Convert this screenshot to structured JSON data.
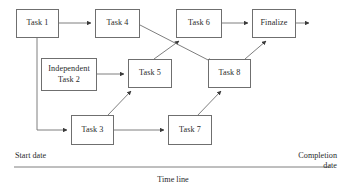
{
  "diagram": {
    "type": "node-link-flow",
    "line_color": "#6f6f6f",
    "text_color": "#2a2a2a",
    "background": "#ffffff",
    "nodes": [
      {
        "id": "task1",
        "label": "Task 1",
        "x": 16,
        "y": 9,
        "w": 43,
        "h": 29
      },
      {
        "id": "task4",
        "label": "Task 4",
        "x": 95,
        "y": 9,
        "w": 45,
        "h": 29
      },
      {
        "id": "task6",
        "label": "Task 6",
        "x": 176,
        "y": 9,
        "w": 46,
        "h": 29
      },
      {
        "id": "finalize",
        "label": "Finalize",
        "x": 252,
        "y": 9,
        "w": 44,
        "h": 29
      },
      {
        "id": "independent",
        "label": "Independent\nTask 2",
        "x": 41,
        "y": 58,
        "w": 56,
        "h": 33
      },
      {
        "id": "task5",
        "label": "Task 5",
        "x": 128,
        "y": 59,
        "w": 44,
        "h": 29
      },
      {
        "id": "task8",
        "label": "Task 8",
        "x": 208,
        "y": 59,
        "w": 43,
        "h": 29
      },
      {
        "id": "task3",
        "label": "Task 3",
        "x": 71,
        "y": 115,
        "w": 43,
        "h": 30
      },
      {
        "id": "task7",
        "label": "Task 7",
        "x": 168,
        "y": 115,
        "w": 44,
        "h": 30
      }
    ],
    "edges": [
      {
        "id": "e-task1-task4",
        "from": "task1",
        "to": "task4",
        "style": "straight-horizontal"
      },
      {
        "id": "e-task1-task3",
        "from": "task1",
        "to": "task3",
        "style": "orthogonal-down-right"
      },
      {
        "id": "e-independent-task5",
        "from": "independent",
        "to": "task5",
        "style": "straight-horizontal"
      },
      {
        "id": "e-task3-task5",
        "from": "task3",
        "to": "task5",
        "style": "diagonal-up-right"
      },
      {
        "id": "e-task3-task7",
        "from": "task3",
        "to": "task7",
        "style": "straight-horizontal"
      },
      {
        "id": "e-task5-task6",
        "from": "task5",
        "to": "task6",
        "style": "diagonal-up-right"
      },
      {
        "id": "e-task4-task8",
        "from": "task4",
        "to": "task8",
        "style": "diagonal-down-right"
      },
      {
        "id": "e-task7-task8",
        "from": "task7",
        "to": "task8",
        "style": "diagonal-up-right"
      },
      {
        "id": "e-task6-finalize",
        "from": "task6",
        "to": "finalize",
        "style": "straight-horizontal"
      },
      {
        "id": "e-task8-finalize",
        "from": "task8",
        "to": "finalize",
        "style": "diagonal-up-right"
      },
      {
        "id": "e-finalize-out",
        "from": "finalize",
        "to": "end",
        "style": "straight-horizontal"
      }
    ]
  },
  "axis": {
    "start_label": "Start date",
    "end_label": "Completion\ndate",
    "axis_label": "Time line",
    "line_y": 167,
    "line_x_start": 14,
    "line_x_end": 330
  }
}
